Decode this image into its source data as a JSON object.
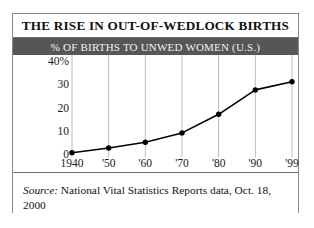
{
  "figure": {
    "title": "THE RISE IN OUT-OF-WEDLOCK BIRTHS",
    "subtitle": "% OF BIRTHS TO UNWED WOMEN (U.S.)",
    "source_label": "Source:",
    "source_text": " National Vital Statistics Reports data, Oct. 18, 2000"
  },
  "colors": {
    "subtitle_bar": "#565656",
    "subtitle_text": "#f2f2f2",
    "frame": "#8a8a8a",
    "gridline": "#bdbdbd",
    "line": "#000000",
    "marker": "#000000",
    "background": "#ffffff"
  },
  "chart_data": {
    "type": "line",
    "title": "THE RISE IN OUT-OF-WEDLOCK BIRTHS",
    "subtitle": "% OF BIRTHS TO UNWED WOMEN (U.S.)",
    "xlabel": "",
    "ylabel": "",
    "categories": [
      "1940",
      "'50",
      "'60",
      "'70",
      "'80",
      "'90",
      "'99"
    ],
    "x_tick_labels": [
      "1940",
      "'50",
      "'60",
      "'70",
      "'80",
      "'90",
      "'99"
    ],
    "y_tick_labels": [
      "40%",
      "30",
      "20",
      "10",
      "0"
    ],
    "y_tick_values": [
      40,
      30,
      20,
      10,
      0
    ],
    "ylim": [
      0,
      40
    ],
    "grid": "vertical",
    "legend": "none",
    "markers": "filled-circle",
    "series": [
      {
        "name": "% of births to unwed women (U.S.)",
        "values": [
          1,
          3,
          5.5,
          9.5,
          17.5,
          28,
          31.5
        ]
      }
    ]
  }
}
